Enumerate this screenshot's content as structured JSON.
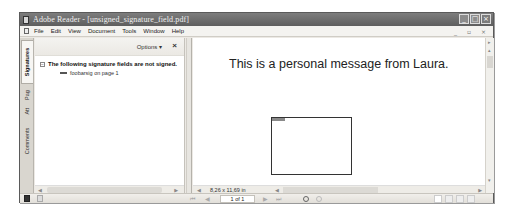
{
  "window": {
    "title": "Adobe Reader - [unsigned_signature_field.pdf]",
    "controls": {
      "minimize": "_",
      "maximize": "□",
      "close": "×"
    }
  },
  "menubar": {
    "items": [
      "File",
      "Edit",
      "View",
      "Document",
      "Tools",
      "Window",
      "Help"
    ],
    "mdi_controls": "_ ▫ ×"
  },
  "sidebar": {
    "tabs": [
      {
        "label": "Signatures",
        "active": true
      },
      {
        "label": "Pages",
        "active": false
      },
      {
        "label": "Attachments",
        "active": false
      },
      {
        "label": "Comments",
        "active": false
      }
    ],
    "tab_display": [
      "Signatures",
      "Pag",
      " Att",
      "Comments"
    ]
  },
  "panel": {
    "options_label": "Options ▾",
    "close_label": "×",
    "tree_expander": "−",
    "tree_header": "The following signature fields are not signed.",
    "tree_children": [
      {
        "label": "foobarsig on page 1"
      }
    ]
  },
  "document": {
    "text": "This is a personal message from Laura.",
    "page_size": "8,26 x 11,69 in",
    "signature_field": {
      "name": "foobarsig",
      "signed": false
    }
  },
  "navigation": {
    "first_page": "⏮",
    "prev_page": "◀",
    "page_indicator": "1 of 1",
    "next_page": "▶",
    "last_page": "⏭"
  },
  "colors": {
    "titlebar": "#6a6a6a",
    "window_bg": "#ece9e4",
    "document_bg": "#ffffff",
    "text": "#222222"
  }
}
